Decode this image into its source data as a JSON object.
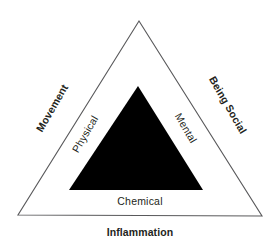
{
  "diagram": {
    "type": "nested-triangle",
    "background_color": "#ffffff",
    "outer_triangle": {
      "name": "outer-triangle",
      "fill": "#ffffff",
      "stroke": "#59595b",
      "stroke_width": 1,
      "apex": [
        139,
        21
      ],
      "bottom_left": [
        18,
        215
      ],
      "bottom_right": [
        262,
        216
      ],
      "labels": [
        {
          "id": "movement",
          "text": "Movement",
          "side": "left",
          "rotation": -60,
          "weight": "bold"
        },
        {
          "id": "being-social",
          "text": "Being Social",
          "side": "right",
          "rotation": 60,
          "weight": "bold"
        },
        {
          "id": "inflammation",
          "text": "Inflammation",
          "side": "bottom",
          "rotation": 0,
          "weight": "bold"
        }
      ]
    },
    "inner_triangle": {
      "name": "inner-triangle",
      "fill": "#000000",
      "stroke": "none",
      "apex": [
        138,
        86
      ],
      "bottom_left": [
        69,
        190
      ],
      "bottom_right": [
        203,
        190
      ],
      "labels": [
        {
          "id": "physical",
          "text": "Physical",
          "side": "left",
          "rotation": -60,
          "weight": "normal"
        },
        {
          "id": "mental",
          "text": "Mental",
          "side": "right",
          "rotation": 60,
          "weight": "normal"
        },
        {
          "id": "chemical",
          "text": "Chemical",
          "side": "bottom",
          "rotation": 0,
          "weight": "normal"
        }
      ]
    },
    "text_color": "#231f20"
  }
}
